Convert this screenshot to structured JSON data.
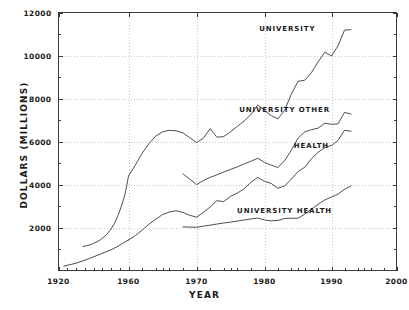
{
  "chart_data": {
    "type": "line",
    "title": "",
    "xlabel": "YEAR",
    "ylabel": "DOLLARS (MILLIONS)",
    "xlim": [
      1920,
      2000
    ],
    "ylim": [
      0,
      12000
    ],
    "grid": true,
    "legend_position": "inline-annotations",
    "x_ticks": [
      1920,
      1960,
      1970,
      1980,
      1990,
      2000
    ],
    "x_tick_labels": [
      "1920",
      "1960",
      "1970",
      "1980",
      "1990",
      "2000"
    ],
    "x_minor_ticks": [
      1925,
      1930,
      1935,
      1940,
      1945,
      1950,
      1955,
      1965,
      1975,
      1985,
      1995
    ],
    "y_ticks": [
      2000,
      4000,
      6000,
      8000,
      10000,
      12000
    ],
    "y_tick_labels": [
      "2000",
      "4000",
      "6000",
      "8000",
      "10000",
      "12000"
    ],
    "y_minor_ticks": [
      1000,
      3000,
      5000,
      7000,
      9000,
      11000
    ],
    "line_color": "#3a3a3a",
    "grid_color": "#c8c8c8",
    "axis_color": "#3a3a3a",
    "series": [
      {
        "name": "UNIVERSITY",
        "label": "UNIVERSITY",
        "label_x": 1983.4,
        "label_y": 11270,
        "x": [
          1934,
          1936,
          1938,
          1940,
          1942,
          1944,
          1946,
          1948,
          1950,
          1952,
          1954,
          1956,
          1958,
          1959,
          1960,
          1961,
          1962,
          1963,
          1964,
          1965,
          1966,
          1967,
          1968,
          1969,
          1970,
          1971,
          1972,
          1973,
          1974,
          1975,
          1976,
          1977,
          1978,
          1979,
          1980,
          1981,
          1982,
          1983,
          1984,
          1985,
          1986,
          1987,
          1988,
          1989,
          1990,
          1991,
          1992,
          1993
        ],
        "values": [
          1120,
          1150,
          1190,
          1260,
          1340,
          1430,
          1560,
          1720,
          1930,
          2200,
          2560,
          3000,
          3550,
          3950,
          4400,
          4900,
          5450,
          5900,
          6250,
          6450,
          6520,
          6500,
          6400,
          6180,
          5950,
          6150,
          6600,
          6200,
          6230,
          6450,
          6700,
          6950,
          7250,
          7700,
          7450,
          7200,
          7050,
          7450,
          8200,
          8800,
          8850,
          9200,
          9700,
          10150,
          9980,
          10450,
          11180,
          11200
        ]
      },
      {
        "name": "UNIVERSITY OTHER",
        "label": "UNIVERSITY OTHER",
        "label_x": 1983.0,
        "label_y": 7520,
        "x": [
          1968,
          1969,
          1970,
          1971,
          1972,
          1973,
          1974,
          1975,
          1976,
          1977,
          1978,
          1979,
          1980,
          1981,
          1982,
          1983,
          1984,
          1985,
          1986,
          1987,
          1988,
          1989,
          1990,
          1991,
          1992,
          1993
        ],
        "values": [
          4500,
          4250,
          4000,
          4180,
          4330,
          4450,
          4580,
          4700,
          4820,
          4960,
          5080,
          5220,
          5030,
          4900,
          4790,
          5100,
          5600,
          6150,
          6450,
          6550,
          6620,
          6850,
          6800,
          6820,
          7350,
          7280
        ]
      },
      {
        "name": "HEALTH",
        "label": "HEALTH",
        "label_x": 1987.0,
        "label_y": 5850,
        "x": [
          1960,
          1961,
          1962,
          1963,
          1964,
          1965,
          1966,
          1967,
          1968,
          1969,
          1970,
          1971,
          1972,
          1973,
          1974,
          1975,
          1976,
          1977,
          1978,
          1979,
          1980,
          1981,
          1982,
          1983,
          1984,
          1985,
          1986,
          1987,
          1988,
          1989,
          1990,
          1991,
          1992,
          1993
        ],
        "values": [
          1420,
          1620,
          1880,
          2150,
          2380,
          2600,
          2720,
          2780,
          2700,
          2570,
          2480,
          2700,
          2950,
          3250,
          3200,
          3450,
          3600,
          3800,
          4100,
          4330,
          4150,
          4050,
          3830,
          3930,
          4250,
          4600,
          4800,
          5200,
          5500,
          5720,
          5820,
          6050,
          6520,
          6480
        ]
      },
      {
        "name": "UNIVERSITY HEALTH",
        "label": "UNIVERSITY HEALTH",
        "label_x": 1983.0,
        "label_y": 2820,
        "x": [
          1968,
          1969,
          1970,
          1971,
          1972,
          1973,
          1974,
          1975,
          1976,
          1977,
          1978,
          1979,
          1980,
          1981,
          1982,
          1983,
          1984,
          1985,
          1986,
          1987,
          1988,
          1989,
          1990,
          1991,
          1992,
          1993
        ],
        "values": [
          2030,
          2020,
          2010,
          2060,
          2110,
          2160,
          2210,
          2250,
          2300,
          2350,
          2400,
          2440,
          2350,
          2310,
          2330,
          2420,
          2430,
          2430,
          2620,
          2850,
          3080,
          3280,
          3420,
          3550,
          3780,
          3930
        ]
      },
      {
        "name": "EARLY BASELINE",
        "label": "",
        "x": [
          1923,
          1926,
          1930,
          1934,
          1938,
          1942,
          1946,
          1950,
          1954,
          1956,
          1958,
          1959,
          1960
        ],
        "values": [
          200,
          260,
          340,
          450,
          570,
          700,
          830,
          960,
          1130,
          1230,
          1330,
          1380,
          1420
        ]
      }
    ]
  }
}
